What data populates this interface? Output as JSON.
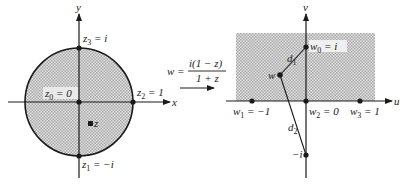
{
  "z_plane": {
    "x_axis_label": "x",
    "y_axis_label": "y",
    "z3_label": "z",
    "z3_sub": "3",
    "z3_value": " = i",
    "z0_label": "z",
    "z0_sub": "0",
    "z0_value": " = 0",
    "z2_label": "z",
    "z2_sub": "2",
    "z2_value": " = 1",
    "z1_label": "z",
    "z1_sub": "1",
    "z1_value": " = −i",
    "z_point_label": "z"
  },
  "mapping": {
    "w_lhs": "w = ",
    "numerator": "i(1 − z)",
    "denominator": "1 + z"
  },
  "w_plane": {
    "u_axis_label": "u",
    "v_axis_label": "v",
    "w0_label": "w",
    "w0_sub": "0",
    "w0_value": " = i",
    "w1_label": "w",
    "w1_sub": "1",
    "w1_value": " = −1",
    "w2_label": "w",
    "w2_sub": "2",
    "w2_value": " = 0",
    "w3_label": "w",
    "w3_sub": "3",
    "w3_value": " = 1",
    "w_point_label": "w",
    "d1_label": "d",
    "d1_sub": "1",
    "d2_label": "d",
    "d2_sub": "2",
    "minus_i_label": "−i"
  },
  "colors": {
    "shade": "#c8c8c8",
    "ink": "#1a1a1a"
  }
}
